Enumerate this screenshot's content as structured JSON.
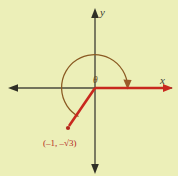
{
  "figure": {
    "name": "angle-in-standard-position",
    "background_color": "#ecefb8",
    "axis_color": "#4a4a3c",
    "ray_color": "#c8281e",
    "arc_color": "#8a5a22",
    "label_color": "#b3271d"
  },
  "axes": {
    "x_label": "x",
    "y_label": "y",
    "origin": {
      "x": 95,
      "y": 88
    }
  },
  "angle": {
    "label": "θ",
    "arc_direction": "counterclockwise",
    "arc_radius": 33
  },
  "point": {
    "label": "(–1, –√3)",
    "x_text": "–1",
    "y_text": "–√3",
    "marker": "dot",
    "pixel": {
      "x": 68,
      "y": 128
    }
  },
  "rays": [
    {
      "name": "initial-side",
      "from": "origin",
      "to_label": "x",
      "direction": "positive-x"
    },
    {
      "name": "terminal-side",
      "from": "origin",
      "to_label": "(–1, –√3)",
      "direction": "quadrant-III"
    }
  ]
}
